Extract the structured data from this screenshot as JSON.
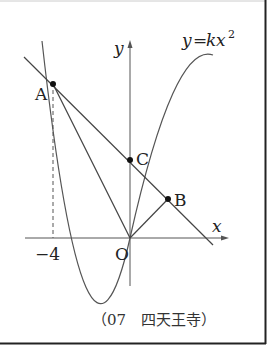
{
  "figure": {
    "curve_label": "y=kx²",
    "curve_label_parts": {
      "y": "y",
      "eq": "=",
      "k": "k",
      "x": "x",
      "exp": "2"
    },
    "axis_x_label": "x",
    "axis_y_label": "y",
    "origin_label": "O",
    "tick_label": "−4",
    "points": {
      "A": "A",
      "B": "B",
      "C": "C"
    },
    "caption": "（07　四天王寺）"
  }
}
